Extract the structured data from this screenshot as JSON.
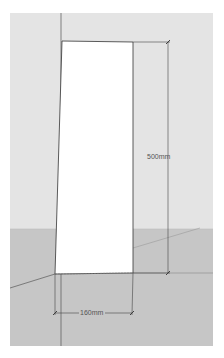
{
  "viewport": {
    "sky_color": "#e4e4e4",
    "ground_color": "#c4c4c4",
    "panel_color": "#ffffff",
    "edge_color": "#333333"
  },
  "model": {
    "panel": {
      "label": "rectangle-panel"
    }
  },
  "dimensions": {
    "height_label": "500mm",
    "width_label": "160mm"
  }
}
